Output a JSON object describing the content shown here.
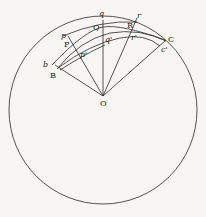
{
  "diagram": {
    "type": "geometric figure",
    "center_label": "O",
    "labels": {
      "b": "b",
      "B": "B",
      "p": "p",
      "P": "P",
      "p_prime": "p'",
      "q": "q",
      "Q": "Q",
      "q_prime": "q'",
      "r": "r",
      "R": "R",
      "r_prime": "r'",
      "C": "C",
      "c_prime": "c'"
    },
    "colors": {
      "line": "#2a2a2a",
      "background": "#f7f6f2"
    }
  }
}
